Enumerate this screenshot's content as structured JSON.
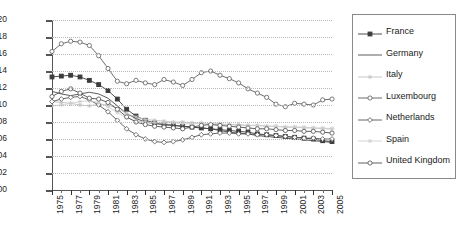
{
  "chart_data": {
    "type": "line",
    "title": "",
    "xlabel": "",
    "ylabel": "",
    "xlim": [
      1975,
      2005
    ],
    "ylim": [
      0.0,
      0.2
    ],
    "grid": true,
    "legend_position": "right",
    "x": [
      1975,
      1976,
      1977,
      1978,
      1979,
      1980,
      1981,
      1982,
      1983,
      1984,
      1985,
      1986,
      1987,
      1988,
      1989,
      1990,
      1991,
      1992,
      1993,
      1994,
      1995,
      1996,
      1997,
      1998,
      1999,
      2000,
      2001,
      2002,
      2003,
      2004,
      2005
    ],
    "x_tick_labels": [
      "1975",
      "1977",
      "1979",
      "1981",
      "1983",
      "1985",
      "1987",
      "1989",
      "1991",
      "1993",
      "1995",
      "1997",
      "1999",
      "2001",
      "2003",
      "2005"
    ],
    "y_tick_labels": [
      "0.00",
      "0.02",
      "0.04",
      "0.06",
      "0.08",
      "0.10",
      "0.12",
      "0.14",
      "0.16",
      "0.18",
      "0.20"
    ],
    "series": [
      {
        "name": "France",
        "color": "#3b3b3b",
        "marker": "filled-square",
        "values": [
          0.133,
          0.134,
          0.135,
          0.133,
          0.129,
          0.124,
          0.117,
          0.107,
          0.095,
          0.087,
          0.082,
          0.079,
          0.077,
          0.076,
          0.075,
          0.074,
          0.073,
          0.072,
          0.071,
          0.07,
          0.069,
          0.068,
          0.066,
          0.065,
          0.064,
          0.063,
          0.062,
          0.061,
          0.06,
          0.058,
          0.057
        ]
      },
      {
        "name": "Germany",
        "color": "#4a4a4a",
        "marker": "none",
        "values": [
          0.116,
          0.113,
          0.111,
          0.113,
          0.115,
          0.113,
          0.108,
          0.099,
          0.09,
          0.084,
          0.08,
          0.078,
          0.077,
          0.076,
          0.075,
          0.074,
          0.073,
          0.072,
          0.07,
          0.068,
          0.067,
          0.066,
          0.064,
          0.063,
          0.062,
          0.061,
          0.06,
          0.059,
          0.058,
          0.057,
          0.056
        ]
      },
      {
        "name": "Italy",
        "color": "#c2c2c2",
        "marker": "star",
        "values": [
          0.104,
          0.103,
          0.102,
          0.1,
          0.099,
          0.101,
          0.1,
          0.096,
          0.09,
          0.086,
          0.083,
          0.082,
          0.081,
          0.08,
          0.08,
          0.079,
          0.079,
          0.078,
          0.078,
          0.077,
          0.077,
          0.076,
          0.076,
          0.075,
          0.075,
          0.074,
          0.074,
          0.073,
          0.073,
          0.072,
          0.072
        ]
      },
      {
        "name": "Luxembourg",
        "color": "#5c5c5c",
        "marker": "open-circle",
        "values": [
          0.163,
          0.172,
          0.175,
          0.174,
          0.17,
          0.158,
          0.143,
          0.128,
          0.125,
          0.129,
          0.126,
          0.124,
          0.13,
          0.127,
          0.123,
          0.13,
          0.138,
          0.14,
          0.135,
          0.131,
          0.126,
          0.119,
          0.114,
          0.109,
          0.101,
          0.098,
          0.102,
          0.101,
          0.1,
          0.106,
          0.107
        ]
      },
      {
        "name": "Netherlands",
        "color": "#555555",
        "marker": "open-diamond",
        "values": [
          0.104,
          0.107,
          0.109,
          0.11,
          0.106,
          0.1,
          0.092,
          0.082,
          0.072,
          0.065,
          0.06,
          0.057,
          0.056,
          0.057,
          0.059,
          0.062,
          0.065,
          0.066,
          0.067,
          0.067,
          0.066,
          0.066,
          0.065,
          0.065,
          0.064,
          0.063,
          0.062,
          0.061,
          0.061,
          0.06,
          0.06
        ]
      },
      {
        "name": "Spain",
        "color": "#cfcfcf",
        "marker": "star",
        "values": [
          0.099,
          0.1,
          0.102,
          0.104,
          0.105,
          0.103,
          0.098,
          0.091,
          0.085,
          0.081,
          0.08,
          0.079,
          0.079,
          0.079,
          0.078,
          0.078,
          0.078,
          0.077,
          0.077,
          0.077,
          0.076,
          0.076,
          0.076,
          0.075,
          0.075,
          0.074,
          0.074,
          0.074,
          0.073,
          0.073,
          0.072
        ]
      },
      {
        "name": "United Kingdom",
        "color": "#4f4f4f",
        "marker": "open-circle",
        "values": [
          0.11,
          0.116,
          0.119,
          0.114,
          0.108,
          0.107,
          0.103,
          0.095,
          0.086,
          0.08,
          0.077,
          0.075,
          0.074,
          0.073,
          0.072,
          0.074,
          0.076,
          0.077,
          0.076,
          0.075,
          0.074,
          0.073,
          0.072,
          0.072,
          0.071,
          0.07,
          0.07,
          0.069,
          0.069,
          0.068,
          0.067
        ]
      }
    ]
  },
  "legend": {
    "items": [
      {
        "label": "France"
      },
      {
        "label": "Germany"
      },
      {
        "label": "Italy"
      },
      {
        "label": "Luxembourg"
      },
      {
        "label": "Netherlands"
      },
      {
        "label": "Spain"
      },
      {
        "label": "United Kingdom"
      }
    ]
  }
}
